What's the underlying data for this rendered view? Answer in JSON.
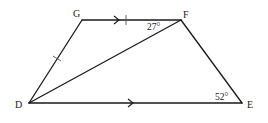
{
  "diagram": {
    "type": "trapezium",
    "colors": {
      "stroke": "#1a1a1a",
      "text": "#222222",
      "background": "#ffffff"
    },
    "vertices": {
      "G": {
        "label": "G",
        "x": 82,
        "y": 20
      },
      "F": {
        "label": "F",
        "x": 181,
        "y": 20
      },
      "D": {
        "label": "D",
        "x": 29,
        "y": 103
      },
      "E": {
        "label": "E",
        "x": 242,
        "y": 103
      }
    },
    "segments": [
      {
        "from": "G",
        "to": "F",
        "marks": [
          "parallel-arrow",
          "equal-tick"
        ]
      },
      {
        "from": "F",
        "to": "E",
        "marks": []
      },
      {
        "from": "D",
        "to": "E",
        "marks": [
          "parallel-arrow"
        ]
      },
      {
        "from": "D",
        "to": "G",
        "marks": [
          "equal-tick"
        ]
      },
      {
        "from": "D",
        "to": "F",
        "marks": []
      }
    ],
    "angles": [
      {
        "at": "F",
        "between": [
          "G",
          "D"
        ],
        "label": "27°"
      },
      {
        "at": "E",
        "between": [
          "D",
          "F"
        ],
        "label": "52°"
      }
    ]
  }
}
